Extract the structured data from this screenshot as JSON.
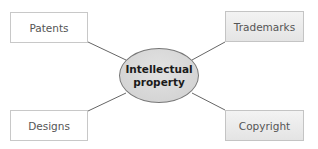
{
  "diagram": {
    "center": {
      "line1": "Intellectual",
      "line2": "property"
    },
    "nodes": [
      {
        "label": "Patents",
        "position": "top-left",
        "fill": "white"
      },
      {
        "label": "Trademarks",
        "position": "top-right",
        "fill": "gray"
      },
      {
        "label": "Designs",
        "position": "bottom-left",
        "fill": "white"
      },
      {
        "label": "Copyright",
        "position": "bottom-right",
        "fill": "gray"
      }
    ]
  },
  "colors": {
    "line": "#666666",
    "ellipse": "#d8d8d8",
    "box_border": "#c8c8c8",
    "text": "#555555"
  }
}
